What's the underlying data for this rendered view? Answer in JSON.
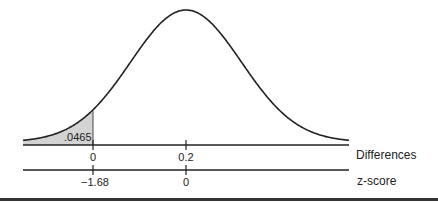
{
  "chart_data": {
    "type": "area",
    "title": "",
    "distribution": {
      "mean": 0.2,
      "peak_label": "0.2"
    },
    "shaded_region": {
      "from": "left tail",
      "to_difference": 0,
      "to_z": -1.68,
      "area": 0.0465,
      "label": ".0465"
    },
    "axes": [
      {
        "name": "Differences",
        "ticks": [
          {
            "value": 0,
            "label": "0"
          },
          {
            "value": 0.2,
            "label": "0.2"
          }
        ]
      },
      {
        "name": "z-score",
        "ticks": [
          {
            "value": -1.68,
            "label": "−1.68"
          },
          {
            "value": 0,
            "label": "0"
          }
        ]
      }
    ],
    "colors": {
      "curve": "#222222",
      "shade": "#d3d3d3",
      "axis": "#222222"
    }
  },
  "labels": {
    "area": ".0465",
    "diff_axis_name": "Differences",
    "z_axis_name": "z-score",
    "diff_tick_0": "0",
    "diff_tick_1": "0.2",
    "z_tick_0": "−1.68",
    "z_tick_1": "0"
  }
}
